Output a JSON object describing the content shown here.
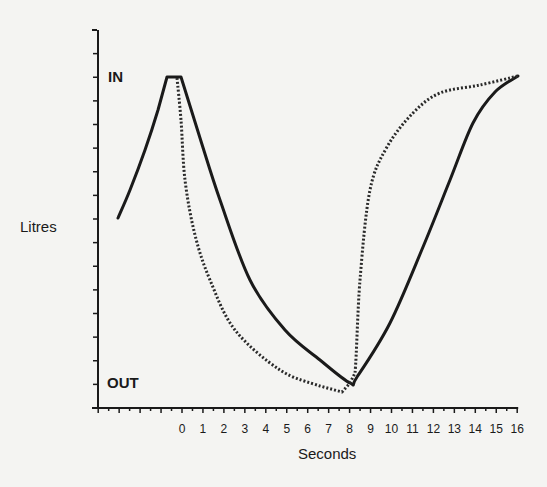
{
  "chart_data": {
    "type": "line",
    "title": "",
    "xlabel": "Seconds",
    "ylabel": "Litres",
    "xlim": [
      -4,
      16
    ],
    "ylim": [
      "OUT",
      "IN"
    ],
    "x_ticks": [
      0,
      1,
      2,
      3,
      4,
      5,
      6,
      7,
      8,
      9,
      10,
      11,
      12,
      13,
      14,
      15,
      16
    ],
    "x_tick_labels": [
      "0",
      "1",
      "2",
      "3",
      "4",
      "5",
      "6",
      "7",
      "8",
      "9",
      "10",
      "11",
      "12",
      "13",
      "14",
      "15",
      "16"
    ],
    "y_annotations": [
      {
        "label": "IN",
        "position": "top"
      },
      {
        "label": "OUT",
        "position": "bottom"
      }
    ],
    "grid": false,
    "legend": null,
    "series": [
      {
        "name": "solid",
        "style": "solid",
        "points_px": [
          [
            118,
            218
          ],
          [
            130,
            190
          ],
          [
            145,
            150
          ],
          [
            158,
            110
          ],
          [
            167,
            77
          ],
          [
            181,
            77
          ],
          [
            200,
            138
          ],
          [
            220,
            200
          ],
          [
            250,
            280
          ],
          [
            285,
            330
          ],
          [
            320,
            360
          ],
          [
            350,
            383
          ],
          [
            357,
            377
          ],
          [
            390,
            323
          ],
          [
            423,
            247
          ],
          [
            450,
            180
          ],
          [
            473,
            123
          ],
          [
            495,
            92
          ],
          [
            518,
            76
          ]
        ],
        "approx_seconds": [
          -3.1,
          -0.7,
          0,
          8,
          12,
          16
        ]
      },
      {
        "name": "dashed",
        "style": "dashed",
        "points_px": [
          [
            177,
            78
          ],
          [
            181,
            120
          ],
          [
            185,
            180
          ],
          [
            195,
            235
          ],
          [
            210,
            280
          ],
          [
            235,
            330
          ],
          [
            280,
            370
          ],
          [
            320,
            386
          ],
          [
            342,
            392
          ],
          [
            350,
            383
          ],
          [
            355,
            373
          ],
          [
            360,
            280
          ],
          [
            370,
            190
          ],
          [
            387,
            147
          ],
          [
            413,
            113
          ],
          [
            440,
            93
          ],
          [
            480,
            85
          ],
          [
            518,
            76
          ]
        ],
        "approx_seconds": [
          -0.2,
          7.7,
          8,
          16
        ]
      }
    ]
  }
}
